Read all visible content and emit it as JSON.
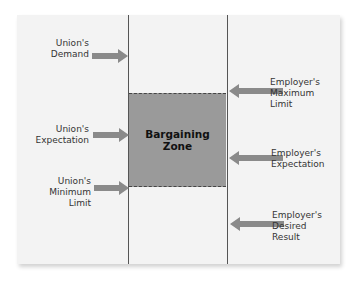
{
  "diagram": {
    "title": "Bargaining Zone",
    "zone_label": "Bargaining\nZone",
    "colors": {
      "panel": "#f3f3f3",
      "zone": "#9a9a9a",
      "arrow": "#8a8a8a",
      "line": "#555555",
      "text": "#333333"
    },
    "union_side": [
      {
        "label": "Union's\nDemand"
      },
      {
        "label": "Union's\nExpectation"
      },
      {
        "label": "Union's\nMinimum\nLimit"
      }
    ],
    "employer_side": [
      {
        "label": "Employer's\nMaximum\nLimit"
      },
      {
        "label": "Employer's\nExpectation"
      },
      {
        "label": "Employer's\nDesired\nResult"
      }
    ]
  }
}
